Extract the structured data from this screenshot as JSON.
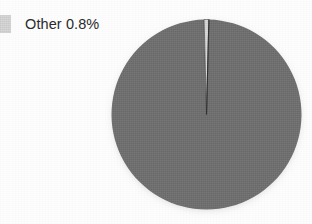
{
  "chart_data": {
    "type": "pie",
    "title": "",
    "categories": [
      "Other",
      "Main"
    ],
    "values": [
      0.8,
      99.2
    ],
    "labels": [
      "Other 0.8%",
      ""
    ],
    "colors": [
      "#d9d9d9",
      "#707070"
    ],
    "legend_position": "top-left",
    "grid": false,
    "start_angle": 0
  },
  "legend": {
    "items": [
      {
        "label": "Other 0.8%",
        "name": "Other",
        "percent": "0.8%",
        "color": "#d9d9d9"
      }
    ]
  },
  "pie": {
    "slices": [
      {
        "name": "Other",
        "percent": 0.8,
        "color": "#d9d9d9"
      },
      {
        "name": "Main",
        "percent": 99.2,
        "color": "#707070"
      }
    ]
  },
  "colors": {
    "background": "#fdfdfd",
    "slice_other": "#d9d9d9",
    "slice_main": "#707070",
    "outline": "#3a3a3a",
    "text": "#2b2b2b"
  }
}
